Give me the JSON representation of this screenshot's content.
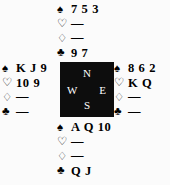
{
  "diagram": {
    "type": "bridge-deal",
    "background_color": "#fbfbfb",
    "text_color": "#000000"
  },
  "suits": {
    "spade": {
      "symbol": "♠",
      "name": "spades"
    },
    "heart": {
      "symbol": "♡",
      "name": "hearts"
    },
    "diamond": {
      "symbol": "♢",
      "name": "diamonds"
    },
    "club": {
      "symbol": "♣",
      "name": "clubs"
    }
  },
  "compass": {
    "background_color": "#0d0d0d",
    "label_color": "#ffffff",
    "north": "N",
    "west": "W",
    "east": "E",
    "south": "S"
  },
  "hands": {
    "north": {
      "position": "North",
      "spades": "7 5 3",
      "hearts": "—",
      "diamonds": "—",
      "clubs": "9 7"
    },
    "west": {
      "position": "West",
      "spades": "K J 9",
      "hearts": "10 9",
      "diamonds": "—",
      "clubs": "—"
    },
    "east": {
      "position": "East",
      "spades": "8 6 2",
      "hearts": "K Q",
      "diamonds": "—",
      "clubs": "—"
    },
    "south": {
      "position": "South",
      "spades": "A Q 10",
      "hearts": "—",
      "diamonds": "—",
      "clubs": "Q J"
    }
  }
}
